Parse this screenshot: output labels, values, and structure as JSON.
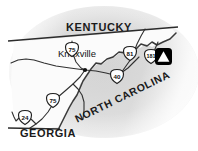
{
  "figure": {
    "name": "east-tennessee-regional-locator-map",
    "width": 198,
    "height": 151,
    "background_color": "#ffffff",
    "blob_color": "#d5d5d5",
    "land_fill": "#fbfbfb",
    "outline_color": "#2b2b2b",
    "road_color": "#303030",
    "marker_color": "#000000"
  },
  "states": [
    {
      "id": "kentucky",
      "label": "KENTUCKY",
      "x": 99,
      "y": 31,
      "rotation": 0,
      "font_size": 11
    },
    {
      "id": "north-carolina",
      "label": "NORTH CAROLINA",
      "x": 124,
      "y": 100,
      "rotation": -26,
      "font_size": 10.5
    },
    {
      "id": "georgia",
      "label": "GEORGIA",
      "x": 48,
      "y": 137,
      "rotation": 0,
      "font_size": 11
    }
  ],
  "cities": [
    {
      "id": "knoxville",
      "label": "Knoxville",
      "label_x": 58,
      "label_y": 57,
      "dot_x": 85,
      "dot_y": 70,
      "font_size": 9.5
    }
  ],
  "highway_shields": [
    {
      "id": "i-75-north",
      "number": "75",
      "x": 72,
      "y": 50
    },
    {
      "id": "i-81",
      "number": "81",
      "x": 130,
      "y": 54
    },
    {
      "id": "i-181",
      "number": "181",
      "x": 151,
      "y": 57
    },
    {
      "id": "i-40",
      "number": "40",
      "x": 117,
      "y": 77
    },
    {
      "id": "i-75-south",
      "number": "75",
      "x": 53,
      "y": 101
    },
    {
      "id": "i-24",
      "number": "24",
      "x": 25,
      "y": 118
    }
  ],
  "markers": [
    {
      "id": "park-landmark",
      "type": "triangle-in-square",
      "x": 163,
      "y": 56,
      "size": 17
    }
  ]
}
